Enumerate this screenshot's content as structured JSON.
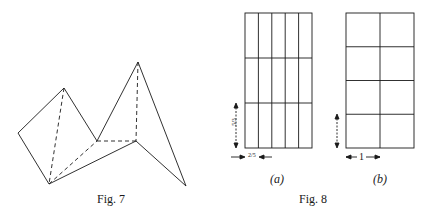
{
  "figures": [
    {
      "id": "fig7",
      "caption": "Fig. 7",
      "description": "Folded polyhedral surface with solid outer edges and dashed hidden edges"
    },
    {
      "id": "fig8",
      "caption": "Fig. 8",
      "panels": [
        {
          "label": "(a)",
          "columns": 5,
          "rows": 3,
          "width_label": "2/5",
          "height_label": "5/3"
        },
        {
          "label": "(b)",
          "columns": 2,
          "rows": 4,
          "width_label": "1",
          "height_label": "1"
        }
      ]
    }
  ],
  "colors": {
    "ink": "#1a1a1a",
    "background": "#ffffff"
  }
}
